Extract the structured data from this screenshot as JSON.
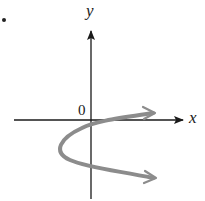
{
  "figure": {
    "axes": {
      "x_label": "x",
      "y_label": "y",
      "origin_label": "0"
    },
    "curve": {
      "description": "Parabola opening to the left with vertex below the x-axis, both branches extending right with arrowheads",
      "color": "#8c8c8c"
    },
    "colors": {
      "axis": "#1a1a1a",
      "curve": "#8c8c8c",
      "background": "#ffffff"
    }
  }
}
